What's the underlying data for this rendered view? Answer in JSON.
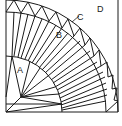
{
  "diagram": {
    "stroke_color": "#1a1a1a",
    "background": "#ffffff",
    "labels": {
      "a": "A",
      "b": "B",
      "c": "C",
      "d": "D"
    },
    "pieces": [
      {
        "id": "A",
        "description": "inner quarter-circle center piece"
      },
      {
        "id": "B",
        "description": "long wedge fan blades"
      },
      {
        "id": "C",
        "description": "outer band of small triangles"
      },
      {
        "id": "D",
        "description": "corner background piece"
      }
    ]
  },
  "caption": {
    "text": ""
  }
}
